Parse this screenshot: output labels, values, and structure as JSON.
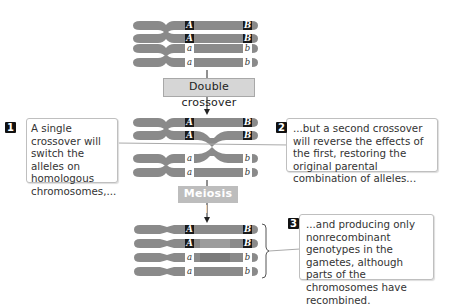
{
  "steps": {
    "double_crossover": "Double crossover",
    "meiosis_ii": "Meiosis II"
  },
  "callouts": [
    {
      "number": "1",
      "text": "A single crossover will switch the alleles on homologous chromosomes,..."
    },
    {
      "number": "2",
      "text": "...but a second crossover will reverse the effects of the first, restoring the original parental combination of alleles..."
    },
    {
      "number": "3",
      "text": "...and producing only nonrecombinant genotypes in the gametes, although parts of the chromosomes have recombined."
    }
  ],
  "alleles": {
    "dominant_1": "A",
    "dominant_2": "B",
    "recessive_1": "a",
    "recessive_2": "b"
  },
  "colors": {
    "chromosome": "#8a8a8a",
    "chromosome_light": "#9a9a9a",
    "dominant_label_bg": "#1a1a1a",
    "step_box_bg": "#d6d6d6",
    "meiosis_box_bg": "#bdbdbd"
  }
}
